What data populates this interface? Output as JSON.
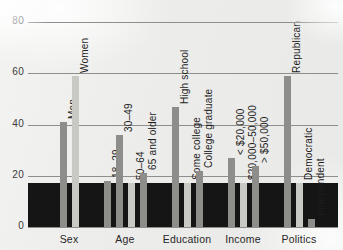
{
  "figure": {
    "background_color": "#ecebe9",
    "band_color": "#151515",
    "gridline_color": "#8e8e8c",
    "bar_color_dark": "#8d8d8a",
    "bar_color_light": "#c9c9c4"
  },
  "chart_data": {
    "type": "bar",
    "title": "",
    "subtitle": "",
    "xlabel": "",
    "ylabel": "",
    "ylim": [
      0,
      80
    ],
    "yticks": [
      "0",
      "20",
      "40",
      "60",
      "80"
    ],
    "ytick_values": [
      0,
      20,
      40,
      60,
      80
    ],
    "grid": true,
    "legend": "none",
    "group_labels": [
      "Sex",
      "Age",
      "Education",
      "Income",
      "Politics"
    ],
    "categories": [
      "Men",
      "Women",
      "18–29",
      "30–49",
      "50–64",
      "65 and older",
      "High school",
      "Some college",
      "College graduate",
      "< $20,000",
      "$20,000–50,000",
      "> $50,000",
      "Republican",
      "Democratic",
      "Independent"
    ],
    "values": [
      41,
      59,
      18,
      36,
      17,
      21,
      47,
      17,
      22,
      27,
      17,
      24,
      59,
      17,
      3
    ],
    "groups": [
      {
        "name": "Sex",
        "bars": [
          {
            "label": "Men",
            "value": 41,
            "shade": "dark"
          },
          {
            "label": "Women",
            "value": 59,
            "shade": "light"
          }
        ]
      },
      {
        "name": "Age",
        "bars": [
          {
            "label": "18–29",
            "value": 18,
            "shade": "dark"
          },
          {
            "label": "30–49",
            "value": 36,
            "shade": "dark"
          },
          {
            "label": "50–64",
            "value": 17,
            "shade": "light"
          },
          {
            "label": "65 and older",
            "value": 21,
            "shade": "dark"
          }
        ]
      },
      {
        "name": "Education",
        "bars": [
          {
            "label": "High school",
            "value": 47,
            "shade": "dark"
          },
          {
            "label": "Some college",
            "value": 17,
            "shade": "light"
          },
          {
            "label": "College graduate",
            "value": 22,
            "shade": "dark"
          }
        ]
      },
      {
        "name": "Income",
        "bars": [
          {
            "label": "< $20,000",
            "value": 27,
            "shade": "dark"
          },
          {
            "label": "$20,000–50,000",
            "value": 17,
            "shade": "light"
          },
          {
            "label": "> $50,000",
            "value": 24,
            "shade": "dark"
          }
        ]
      },
      {
        "name": "Politics",
        "bars": [
          {
            "label": "Republican",
            "value": 59,
            "shade": "dark"
          },
          {
            "label": "Democratic",
            "value": 17,
            "shade": "light"
          },
          {
            "label": "Independent",
            "value": 3,
            "shade": "dark"
          }
        ]
      }
    ],
    "overlay_band": {
      "from": 0,
      "to": 17
    }
  }
}
